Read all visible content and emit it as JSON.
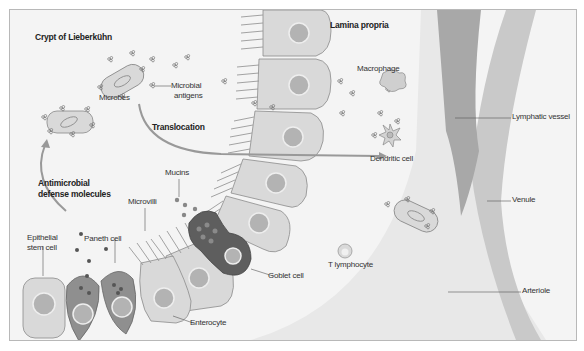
{
  "regions": {
    "crypt": "Crypt of Lieberkühn",
    "lamina_propria": "Lamina propria"
  },
  "processes": {
    "translocation": "Translocation",
    "antimicrobial": [
      "Antimicrobial",
      "defense molecules"
    ]
  },
  "labels": {
    "microbes": "Microbes",
    "microbial_antigens": [
      "Microbial",
      "antigens"
    ],
    "macrophage": "Macrophage",
    "dendritic_cell": "Dendritic cell",
    "t_lymphocyte": "T lymphocyte",
    "mucins": "Mucins",
    "microvilli": "Microvilli",
    "epithelial_stem_cell": [
      "Epithelial",
      "stem cell"
    ],
    "paneth_cell": "Paneth cell",
    "goblet_cell": "Goblet cell",
    "enterocyte": "Enterocyte",
    "lymphatic_vessel": "Lymphatic vessel",
    "venule": "Venule",
    "arteriole": "Arteriole"
  },
  "colors": {
    "background": "#f4f4f4",
    "cell_fill": "#d9d9d9",
    "cell_stroke": "#8c8c8c",
    "nucleus": "#b3b3b3",
    "paneth": "#8f8f8f",
    "goblet": "#5e5e5e",
    "lymphatic": "#a6a6a6",
    "venule": "#c6c6c6",
    "arteriole": "#e6e6e6"
  }
}
